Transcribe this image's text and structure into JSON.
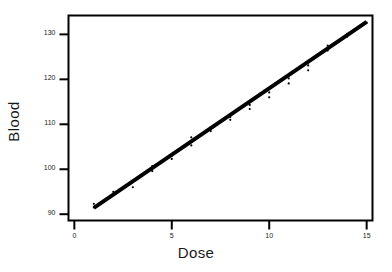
{
  "chart_data": {
    "type": "scatter",
    "title": "",
    "xlabel": "Dose",
    "ylabel": "Blood",
    "xlim": [
      -0.3,
      15.3
    ],
    "ylim": [
      88.6,
      134.2
    ],
    "xticks": [
      0,
      5,
      10,
      15
    ],
    "xtick_labels": [
      "0",
      "5",
      "10",
      "15"
    ],
    "yticks": [
      90,
      100,
      110,
      120,
      130
    ],
    "ytick_labels": [
      "90",
      "100",
      "110",
      "120",
      "130"
    ],
    "grid": false,
    "legend": null,
    "frame": "box",
    "series": [
      {
        "name": "observations",
        "marker": "point",
        "color": "#000000",
        "x": [
          1,
          1,
          2,
          2,
          3,
          3,
          4,
          4,
          5,
          5,
          6,
          6,
          7,
          7,
          8,
          8,
          9,
          9,
          10,
          10,
          11,
          11,
          12,
          12,
          13,
          13,
          14,
          14,
          15
        ],
        "y": [
          91.5,
          92.3,
          94.6,
          95.0,
          96.0,
          97.4,
          99.6,
          100.7,
          102.3,
          103.0,
          105.3,
          107.1,
          108.5,
          109.4,
          111.0,
          111.6,
          114.3,
          113.4,
          116.0,
          117.1,
          120.2,
          119.1,
          122.0,
          123.1,
          126.4,
          127.5,
          129.5,
          130.1,
          132.6
        ]
      },
      {
        "name": "fitted-line",
        "type": "line",
        "color": "#000000",
        "linewidth": 4,
        "x": [
          1,
          15
        ],
        "y": [
          91.4,
          132.8
        ]
      }
    ]
  },
  "axes": {
    "x_title": "Dose",
    "y_title": "Blood"
  }
}
